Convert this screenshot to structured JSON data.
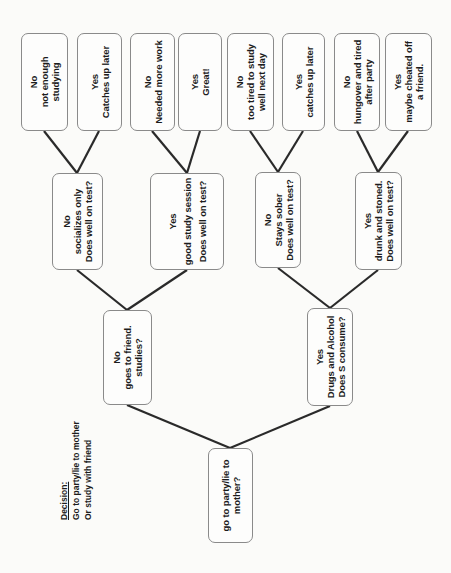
{
  "colors": {
    "background": "#fbfbf9",
    "box_fill": "#fdfdfc",
    "box_border": "#8a8a8a",
    "edge_line": "#2a2a2a",
    "text": "#1c1c1c"
  },
  "note": {
    "title": "Decision:",
    "option1": "Go to party/lie to mother",
    "option2": "Or study with friend"
  },
  "tree": {
    "nodes": {
      "root": "go to party/lie to\nmother?",
      "goes_to_friend": "No\ngoes to friend.\nstudies?",
      "drugs_alcohol": "Yes\nDrugs and Alcohol\nDoes S consume?",
      "socializes_only": "No\nsocializes only\nDoes well on test?",
      "good_study_session": "Yes\ngood study session\nDoes well on test?",
      "stays_sober": "No\nStays sober\nDoes well on test?",
      "drunk_stoned": "Yes\ndrunk and stoned.\nDoes well on test?",
      "not_enough_studying": "No\nnot enough\nstudying",
      "catches_up_later_a": "Yes\nCatches up later",
      "needed_more_work": "No\nNeeded more work",
      "great": "Yes\nGreat!",
      "too_tired": "No\ntoo tired to study\nwell next day",
      "catches_up_later_b": "Yes\ncatches up later",
      "hungover": "No\nhungover and tired\nafter party",
      "maybe_cheated": "Yes\nmaybe cheated off\na friend."
    }
  }
}
